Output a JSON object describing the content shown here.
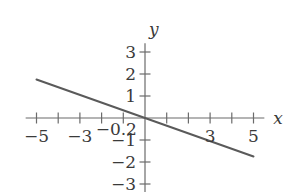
{
  "figure": {
    "background_color": "#ffffff",
    "axis_color": "#6b6b6b",
    "line_color": "#5a5a5a",
    "text_color": "#3a3a3a",
    "x_axis_name": "x",
    "y_axis_name": "y",
    "intercept_label": "−0.2"
  },
  "chart_data": {
    "type": "line",
    "title": "",
    "xlabel": "x",
    "ylabel": "y",
    "xlim": [
      -5.5,
      5.5
    ],
    "ylim": [
      -3.6,
      3.4
    ],
    "grid": false,
    "legend": false,
    "xticks": [
      -5,
      -4,
      -3,
      -2,
      -1,
      0,
      1,
      2,
      3,
      4,
      5
    ],
    "yticks": [
      -3,
      -2,
      -1,
      0,
      1,
      2,
      3
    ],
    "xtick_labels": [
      "−5",
      "",
      "−3",
      "",
      "",
      "",
      "",
      "",
      "3",
      "",
      "5"
    ],
    "ytick_labels": [
      "−3",
      "−2",
      "−1",
      "",
      "1",
      "2",
      "3"
    ],
    "annotations": [
      {
        "text": "−0.2",
        "x": -0.2,
        "y": -0.55
      }
    ],
    "series": [
      {
        "name": "line",
        "slope": -0.35,
        "intercept": 0,
        "x": [
          -5,
          5
        ],
        "values": [
          1.75,
          -1.75
        ]
      }
    ]
  },
  "geometry": {
    "origin_x": 145,
    "origin_y": 118,
    "unit_x": 21.7,
    "unit_y": 22.0
  }
}
